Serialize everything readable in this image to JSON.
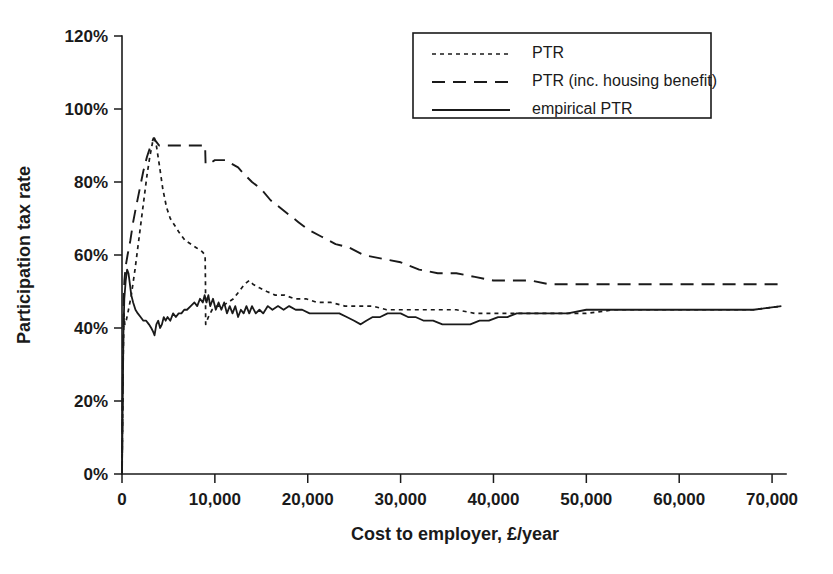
{
  "chart_data": {
    "type": "line",
    "title": "",
    "xlabel": "Cost to employer, £/year",
    "ylabel": "Participation tax rate",
    "xlim": [
      0,
      71500
    ],
    "ylim": [
      0,
      120
    ],
    "grid": false,
    "legend_position": "top-right",
    "xticks": [
      0,
      10000,
      20000,
      30000,
      40000,
      50000,
      60000,
      70000
    ],
    "xtick_labels": [
      "0",
      "10,000",
      "20,000",
      "30,000",
      "40,000",
      "50,000",
      "60,000",
      "70,000"
    ],
    "yticks": [
      0,
      20,
      40,
      60,
      80,
      100,
      120
    ],
    "ytick_labels": [
      "0%",
      "20%",
      "40%",
      "60%",
      "80%",
      "100%",
      "120%"
    ],
    "series": [
      {
        "name": "PTR",
        "style": "short-dash",
        "color": "#1a1a1a",
        "points": [
          [
            0,
            0
          ],
          [
            120,
            30
          ],
          [
            200,
            44
          ],
          [
            300,
            41
          ],
          [
            450,
            42
          ],
          [
            700,
            45
          ],
          [
            1000,
            49
          ],
          [
            1400,
            56
          ],
          [
            1800,
            64
          ],
          [
            2300,
            74
          ],
          [
            2700,
            82
          ],
          [
            3000,
            87
          ],
          [
            3300,
            91
          ],
          [
            3500,
            92
          ],
          [
            3700,
            90
          ],
          [
            4000,
            85
          ],
          [
            4400,
            78
          ],
          [
            4800,
            73
          ],
          [
            5200,
            70
          ],
          [
            5700,
            68
          ],
          [
            6200,
            66
          ],
          [
            6800,
            64
          ],
          [
            7400,
            63
          ],
          [
            8000,
            62
          ],
          [
            8600,
            61
          ],
          [
            8950,
            60
          ],
          [
            8990,
            52
          ],
          [
            9000,
            45
          ],
          [
            9010,
            41
          ],
          [
            9300,
            43
          ],
          [
            9700,
            45
          ],
          [
            10200,
            46
          ],
          [
            10800,
            46
          ],
          [
            11400,
            47
          ],
          [
            12000,
            48
          ],
          [
            12600,
            50
          ],
          [
            13200,
            52
          ],
          [
            13700,
            53
          ],
          [
            14100,
            52
          ],
          [
            14800,
            51
          ],
          [
            15600,
            50
          ],
          [
            16500,
            49
          ],
          [
            17500,
            49
          ],
          [
            18600,
            48
          ],
          [
            19800,
            48
          ],
          [
            21000,
            47
          ],
          [
            22500,
            47
          ],
          [
            24000,
            46
          ],
          [
            25500,
            46
          ],
          [
            27000,
            46
          ],
          [
            28500,
            45
          ],
          [
            30000,
            45
          ],
          [
            32000,
            45
          ],
          [
            34000,
            45
          ],
          [
            36000,
            45
          ],
          [
            38000,
            44
          ],
          [
            40000,
            44
          ],
          [
            42000,
            44
          ],
          [
            44000,
            44
          ],
          [
            46000,
            44
          ],
          [
            48000,
            44
          ],
          [
            50000,
            44
          ],
          [
            53000,
            45
          ],
          [
            56000,
            45
          ],
          [
            60000,
            45
          ],
          [
            64000,
            45
          ],
          [
            68000,
            45
          ],
          [
            71000,
            46
          ]
        ]
      },
      {
        "name": "PTR (inc. housing benefit)",
        "style": "long-dash",
        "color": "#1a1a1a",
        "points": [
          [
            0,
            0
          ],
          [
            100,
            30
          ],
          [
            180,
            48
          ],
          [
            260,
            53
          ],
          [
            400,
            57
          ],
          [
            600,
            60
          ],
          [
            900,
            64
          ],
          [
            1200,
            69
          ],
          [
            1500,
            73
          ],
          [
            1900,
            78
          ],
          [
            2300,
            83
          ],
          [
            2700,
            87
          ],
          [
            3100,
            90
          ],
          [
            3400,
            92
          ],
          [
            3700,
            91
          ],
          [
            4000,
            90
          ],
          [
            4500,
            90
          ],
          [
            5200,
            90
          ],
          [
            6000,
            90
          ],
          [
            7000,
            90
          ],
          [
            8000,
            90
          ],
          [
            8800,
            90
          ],
          [
            8950,
            90
          ],
          [
            8980,
            87
          ],
          [
            9000,
            85
          ],
          [
            9400,
            85
          ],
          [
            10000,
            86
          ],
          [
            10600,
            86
          ],
          [
            11200,
            86
          ],
          [
            11800,
            85
          ],
          [
            12500,
            84
          ],
          [
            13200,
            82
          ],
          [
            14000,
            80
          ],
          [
            15000,
            78
          ],
          [
            16000,
            75
          ],
          [
            17000,
            73
          ],
          [
            18000,
            71
          ],
          [
            19000,
            69
          ],
          [
            20000,
            67
          ],
          [
            21500,
            65
          ],
          [
            23000,
            63
          ],
          [
            24500,
            62
          ],
          [
            26000,
            60
          ],
          [
            28000,
            59
          ],
          [
            30000,
            58
          ],
          [
            32000,
            56
          ],
          [
            34000,
            55
          ],
          [
            36000,
            55
          ],
          [
            38000,
            54
          ],
          [
            40000,
            53
          ],
          [
            42000,
            53
          ],
          [
            44000,
            53
          ],
          [
            46000,
            52
          ],
          [
            48000,
            52
          ],
          [
            51000,
            52
          ],
          [
            55000,
            52
          ],
          [
            60000,
            52
          ],
          [
            65000,
            52
          ],
          [
            71000,
            52
          ]
        ]
      },
      {
        "name": "empirical PTR",
        "style": "solid",
        "color": "#1a1a1a",
        "points": [
          [
            0,
            0
          ],
          [
            80,
            20
          ],
          [
            150,
            38
          ],
          [
            250,
            48
          ],
          [
            400,
            53
          ],
          [
            550,
            56
          ],
          [
            700,
            55
          ],
          [
            850,
            52
          ],
          [
            1000,
            49
          ],
          [
            1200,
            47
          ],
          [
            1450,
            45
          ],
          [
            1700,
            44
          ],
          [
            2000,
            43
          ],
          [
            2300,
            42
          ],
          [
            2600,
            42
          ],
          [
            2900,
            41
          ],
          [
            3150,
            40
          ],
          [
            3350,
            39
          ],
          [
            3500,
            38
          ],
          [
            3700,
            41
          ],
          [
            3900,
            42
          ],
          [
            4100,
            40
          ],
          [
            4300,
            41
          ],
          [
            4500,
            43
          ],
          [
            4700,
            42
          ],
          [
            4900,
            43
          ],
          [
            5200,
            42
          ],
          [
            5500,
            44
          ],
          [
            5800,
            43
          ],
          [
            6100,
            44
          ],
          [
            6400,
            44
          ],
          [
            6700,
            45
          ],
          [
            7000,
            45
          ],
          [
            7400,
            46
          ],
          [
            7800,
            47
          ],
          [
            8100,
            46
          ],
          [
            8400,
            48
          ],
          [
            8700,
            47
          ],
          [
            8900,
            49
          ],
          [
            9100,
            47
          ],
          [
            9300,
            49
          ],
          [
            9500,
            46
          ],
          [
            9800,
            48
          ],
          [
            10100,
            45
          ],
          [
            10400,
            47
          ],
          [
            10700,
            45
          ],
          [
            11000,
            47
          ],
          [
            11300,
            44
          ],
          [
            11600,
            46
          ],
          [
            11900,
            44
          ],
          [
            12200,
            46
          ],
          [
            12500,
            43
          ],
          [
            12800,
            45
          ],
          [
            13100,
            44
          ],
          [
            13400,
            46
          ],
          [
            13700,
            44
          ],
          [
            14000,
            46
          ],
          [
            14400,
            44
          ],
          [
            14800,
            45
          ],
          [
            15200,
            44
          ],
          [
            15700,
            46
          ],
          [
            16200,
            45
          ],
          [
            16800,
            46
          ],
          [
            17400,
            45
          ],
          [
            18000,
            46
          ],
          [
            18700,
            45
          ],
          [
            19400,
            45
          ],
          [
            20200,
            44
          ],
          [
            21000,
            44
          ],
          [
            21800,
            44
          ],
          [
            22600,
            44
          ],
          [
            23400,
            44
          ],
          [
            24200,
            43
          ],
          [
            25000,
            42
          ],
          [
            25700,
            41
          ],
          [
            26300,
            42
          ],
          [
            27000,
            43
          ],
          [
            27800,
            43
          ],
          [
            28600,
            44
          ],
          [
            29400,
            44
          ],
          [
            30000,
            44
          ],
          [
            30800,
            43
          ],
          [
            31600,
            43
          ],
          [
            32500,
            42
          ],
          [
            33500,
            42
          ],
          [
            34500,
            41
          ],
          [
            35500,
            41
          ],
          [
            36500,
            41
          ],
          [
            37500,
            41
          ],
          [
            38500,
            42
          ],
          [
            39500,
            42
          ],
          [
            40500,
            43
          ],
          [
            41500,
            43
          ],
          [
            42500,
            44
          ],
          [
            43500,
            44
          ],
          [
            44500,
            44
          ],
          [
            46000,
            44
          ],
          [
            48000,
            44
          ],
          [
            50000,
            45
          ],
          [
            53000,
            45
          ],
          [
            56000,
            45
          ],
          [
            60000,
            45
          ],
          [
            64000,
            45
          ],
          [
            68000,
            45
          ],
          [
            71000,
            46
          ]
        ]
      }
    ],
    "annotations": {
      "ptr_peak": 92,
      "ptr_hb_peak": 92,
      "empirical_peak": 56,
      "empirical_min": 38,
      "ptr_hb_asymptote": 52,
      "ptr_asymptote": 45
    }
  },
  "legend": {
    "entries": [
      {
        "label": "PTR",
        "style": "short-dash"
      },
      {
        "label": "PTR (inc. housing benefit)",
        "style": "long-dash"
      },
      {
        "label": "empirical PTR",
        "style": "solid"
      }
    ]
  },
  "axes": {
    "y_title": "Participation tax rate",
    "x_title": "Cost to employer, £/year"
  }
}
